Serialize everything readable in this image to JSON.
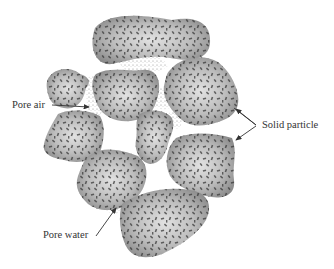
{
  "diagram": {
    "labels": {
      "pore_air": "Pore air",
      "solid_particle": "Solid particle",
      "pore_water": "Pore water"
    },
    "colors": {
      "particle_fill_center": "#d8d8d8",
      "particle_fill_edge": "#8c8c8c",
      "particle_speckle": "#3a3a3a",
      "pore_water_dots": "#7a7a7a",
      "label_text": "#333333",
      "arrow": "#333333",
      "background": "#ffffff"
    },
    "components": [
      "solid particle",
      "pore air",
      "pore water"
    ]
  }
}
